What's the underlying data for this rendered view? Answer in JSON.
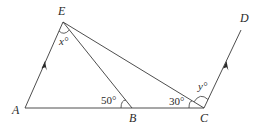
{
  "diagram": {
    "points": {
      "A": {
        "label": "A",
        "x": 25,
        "y": 108
      },
      "B": {
        "label": "B",
        "x": 132,
        "y": 108
      },
      "C": {
        "label": "C",
        "x": 204,
        "y": 108
      },
      "D": {
        "label": "D",
        "x": 241,
        "y": 30
      },
      "E": {
        "label": "E",
        "x": 63,
        "y": 22
      }
    },
    "segments": [
      "AE",
      "AB",
      "BC",
      "EB",
      "EC",
      "CD"
    ],
    "parallel_marks": [
      "AE",
      "CD"
    ],
    "angles": {
      "AEB": {
        "label": "x°",
        "vertex": "E"
      },
      "EBA": {
        "label": "50°",
        "vertex": "B"
      },
      "ECB": {
        "label": "30°",
        "vertex": "C"
      },
      "ECD": {
        "label": "y°",
        "vertex": "C"
      }
    }
  }
}
